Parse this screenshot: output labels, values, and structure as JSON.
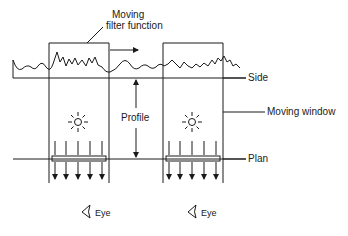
{
  "diagram": {
    "type": "schematic",
    "labels": {
      "filter_function_line1": "Moving",
      "filter_function_line2": "filter function",
      "side": "Side",
      "profile": "Profile",
      "moving_window": "Moving window",
      "plan": "Plan",
      "eye_left": "Eye",
      "eye_right": "Eye"
    },
    "elements": [
      {
        "name": "moving-window",
        "count": 2
      },
      {
        "name": "profile-waveform",
        "description": "irregular surface profile line"
      },
      {
        "name": "light-source",
        "count": 2
      },
      {
        "name": "plan-filter-bar",
        "count": 2
      },
      {
        "name": "downward-arrows",
        "per_window": 5
      },
      {
        "name": "eye",
        "count": 2
      }
    ],
    "colors": {
      "stroke": "#1a1a1a",
      "background": "#ffffff"
    }
  }
}
